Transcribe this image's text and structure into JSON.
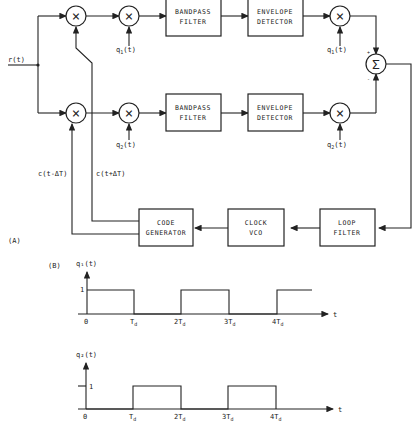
{
  "figure": {
    "part_a_label": "(A)",
    "part_b_label": "(B)"
  },
  "blocks": {
    "bpf_top": [
      "BANDPASS",
      "FILTER"
    ],
    "bpf_bottom": [
      "BANDPASS",
      "FILTER"
    ],
    "env_top": [
      "ENVELOPE",
      "DETECTOR"
    ],
    "env_bottom": [
      "ENVELOPE",
      "DETECTOR"
    ],
    "code_gen": [
      "CODE",
      "GENERATOR"
    ],
    "clock_vco": [
      "CLOCK",
      "VCO"
    ],
    "loop_filter": [
      "LOOP",
      "FILTER"
    ]
  },
  "symbols": {
    "multiplier": "×",
    "summer": "Σ",
    "plus": "+",
    "minus": "-"
  },
  "signals": {
    "input": "r(t)",
    "q1_main": "q",
    "q1_sub": "1",
    "q2_main": "q",
    "q2_sub": "2",
    "t_arg": "(t)",
    "c_early": "c(t-ΔT)",
    "c_late": "c(t+ΔT)"
  },
  "waveforms": {
    "q1": {
      "ylabel": "q₁(t)",
      "level": "1",
      "xlabel": "t",
      "ticks": [
        "0",
        "T",
        "2T",
        "3T",
        "4T"
      ],
      "tick_sub": "d",
      "high_intervals": [
        [
          0,
          1
        ],
        [
          2,
          3
        ],
        [
          4,
          4.7
        ]
      ]
    },
    "q2": {
      "ylabel": "q₂(t)",
      "level": "1",
      "xlabel": "t",
      "ticks": [
        "0",
        "T",
        "2T",
        "3T",
        "4T"
      ],
      "tick_sub": "d",
      "high_intervals": [
        [
          1,
          2
        ],
        [
          3,
          4
        ]
      ]
    }
  }
}
